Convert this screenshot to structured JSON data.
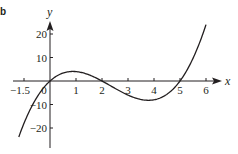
{
  "chart_data": {
    "type": "line",
    "title": "",
    "part_label": "b",
    "xlabel": "x",
    "ylabel": "y",
    "function": "y = x(x - 2)(x - 5)",
    "x_ticks": [
      {
        "value": -1,
        "label": "−1.5"
      },
      {
        "value": 0,
        "label": "0"
      },
      {
        "value": 1,
        "label": "1"
      },
      {
        "value": 2,
        "label": "2"
      },
      {
        "value": 3,
        "label": "3"
      },
      {
        "value": 4,
        "label": "4"
      },
      {
        "value": 5,
        "label": "5"
      },
      {
        "value": 6,
        "label": "6"
      }
    ],
    "y_ticks": [
      {
        "value": 20,
        "label": "20"
      },
      {
        "value": 10,
        "label": "10"
      },
      {
        "value": -10,
        "label": "−10"
      },
      {
        "value": -20,
        "label": "−20"
      }
    ],
    "xlim": [
      -1.4,
      6.5
    ],
    "ylim": [
      -28,
      25
    ],
    "grid": false,
    "legend": null,
    "series": [
      {
        "name": "curve",
        "x": [
          -1.2,
          -1,
          -0.5,
          0,
          0.5,
          1,
          1.5,
          2,
          2.5,
          3,
          3.5,
          4,
          4.5,
          5,
          5.5,
          6
        ],
        "y": [
          -26.2,
          -18,
          -6.9,
          0,
          3.4,
          4,
          2.6,
          0,
          -3.1,
          -6,
          -7.9,
          -8,
          -5.6,
          0,
          9.6,
          24
        ]
      }
    ],
    "roots": [
      0,
      2,
      5
    ],
    "local_max": {
      "x": 0.9,
      "y": 4.1
    },
    "local_min": {
      "x": 3.8,
      "y": -8.2
    },
    "colors": {
      "line": "#231f20",
      "background": "#ffffff"
    }
  }
}
